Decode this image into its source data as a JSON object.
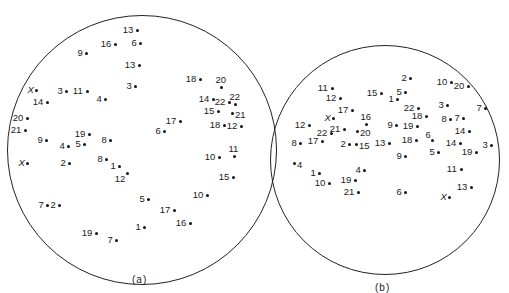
{
  "figure": {
    "panels": [
      {
        "id": "a",
        "caption": "(a)",
        "circle": {
          "cx": 142,
          "cy": 150,
          "r": 135
        },
        "points": [
          {
            "label": "13",
            "x": 137,
            "y": 30,
            "side": "left"
          },
          {
            "label": "6",
            "x": 140,
            "y": 43,
            "side": "left"
          },
          {
            "label": "16",
            "x": 115,
            "y": 44,
            "side": "left"
          },
          {
            "label": "9",
            "x": 86,
            "y": 53,
            "side": "left"
          },
          {
            "label": "13",
            "x": 139,
            "y": 65,
            "side": "left"
          },
          {
            "label": "3",
            "x": 135,
            "y": 86,
            "side": "left"
          },
          {
            "label": "X",
            "x": 36,
            "y": 90,
            "side": "left"
          },
          {
            "label": "3",
            "x": 66,
            "y": 91,
            "side": "left"
          },
          {
            "label": "11",
            "x": 87,
            "y": 91,
            "side": "left"
          },
          {
            "label": "4",
            "x": 105,
            "y": 99,
            "side": "left"
          },
          {
            "label": "14",
            "x": 47,
            "y": 102,
            "side": "left"
          },
          {
            "label": "18",
            "x": 200,
            "y": 79,
            "side": "left"
          },
          {
            "label": "20",
            "x": 221,
            "y": 87,
            "side": "above"
          },
          {
            "label": "14",
            "x": 213,
            "y": 99,
            "side": "left"
          },
          {
            "label": "22",
            "x": 229,
            "y": 102,
            "side": "left"
          },
          {
            "label": "22",
            "x": 235,
            "y": 104,
            "side": "above"
          },
          {
            "label": "15",
            "x": 218,
            "y": 111,
            "side": "left"
          },
          {
            "label": "21",
            "x": 232,
            "y": 113,
            "side": "right"
          },
          {
            "label": "17",
            "x": 180,
            "y": 121,
            "side": "left"
          },
          {
            "label": "6",
            "x": 164,
            "y": 131,
            "side": "left"
          },
          {
            "label": "18",
            "x": 224,
            "y": 125,
            "side": "left"
          },
          {
            "label": "12",
            "x": 241,
            "y": 126,
            "side": "left"
          },
          {
            "label": "20",
            "x": 27,
            "y": 118,
            "side": "left"
          },
          {
            "label": "21",
            "x": 25,
            "y": 130,
            "side": "left"
          },
          {
            "label": "9",
            "x": 46,
            "y": 140,
            "side": "left"
          },
          {
            "label": "4",
            "x": 68,
            "y": 146,
            "side": "left"
          },
          {
            "label": "5",
            "x": 84,
            "y": 144,
            "side": "left"
          },
          {
            "label": "19",
            "x": 89,
            "y": 134,
            "side": "left"
          },
          {
            "label": "8",
            "x": 110,
            "y": 140,
            "side": "left"
          },
          {
            "label": "X",
            "x": 27,
            "y": 163,
            "side": "left"
          },
          {
            "label": "2",
            "x": 69,
            "y": 163,
            "side": "left"
          },
          {
            "label": "8",
            "x": 106,
            "y": 159,
            "side": "left"
          },
          {
            "label": "1",
            "x": 119,
            "y": 166,
            "side": "left"
          },
          {
            "label": "12",
            "x": 127,
            "y": 173,
            "side": "below-left"
          },
          {
            "label": "10",
            "x": 219,
            "y": 157,
            "side": "left"
          },
          {
            "label": "11",
            "x": 234,
            "y": 156,
            "side": "above"
          },
          {
            "label": "15",
            "x": 233,
            "y": 177,
            "side": "left"
          },
          {
            "label": "5",
            "x": 148,
            "y": 199,
            "side": "left"
          },
          {
            "label": "10",
            "x": 207,
            "y": 195,
            "side": "left"
          },
          {
            "label": "7",
            "x": 47,
            "y": 205,
            "side": "left"
          },
          {
            "label": "2",
            "x": 59,
            "y": 205,
            "side": "left"
          },
          {
            "label": "17",
            "x": 174,
            "y": 210,
            "side": "left"
          },
          {
            "label": "1",
            "x": 144,
            "y": 227,
            "side": "left"
          },
          {
            "label": "16",
            "x": 190,
            "y": 223,
            "side": "left"
          },
          {
            "label": "19",
            "x": 96,
            "y": 233,
            "side": "left"
          },
          {
            "label": "7",
            "x": 116,
            "y": 240,
            "side": "left"
          }
        ]
      },
      {
        "id": "b",
        "caption": "(b)",
        "circle": {
          "cx": 385,
          "cy": 160,
          "r": 115
        },
        "points": [
          {
            "label": "2",
            "x": 410,
            "y": 78,
            "side": "left"
          },
          {
            "label": "10",
            "x": 451,
            "y": 82,
            "side": "left"
          },
          {
            "label": "20",
            "x": 468,
            "y": 86,
            "side": "left"
          },
          {
            "label": "11",
            "x": 332,
            "y": 88,
            "side": "left"
          },
          {
            "label": "15",
            "x": 381,
            "y": 93,
            "side": "left"
          },
          {
            "label": "5",
            "x": 405,
            "y": 92,
            "side": "left"
          },
          {
            "label": "1",
            "x": 397,
            "y": 99,
            "side": "left"
          },
          {
            "label": "12",
            "x": 340,
            "y": 98,
            "side": "left"
          },
          {
            "label": "22",
            "x": 418,
            "y": 108,
            "side": "left"
          },
          {
            "label": "3",
            "x": 447,
            "y": 105,
            "side": "left"
          },
          {
            "label": "7",
            "x": 485,
            "y": 108,
            "side": "left"
          },
          {
            "label": "17",
            "x": 352,
            "y": 110,
            "side": "left"
          },
          {
            "label": "18",
            "x": 426,
            "y": 116,
            "side": "left"
          },
          {
            "label": "8",
            "x": 450,
            "y": 119,
            "side": "left"
          },
          {
            "label": "7",
            "x": 463,
            "y": 118,
            "side": "left"
          },
          {
            "label": "X",
            "x": 333,
            "y": 118,
            "side": "left"
          },
          {
            "label": "16",
            "x": 366,
            "y": 124,
            "side": "above"
          },
          {
            "label": "12",
            "x": 309,
            "y": 125,
            "side": "left"
          },
          {
            "label": "21",
            "x": 344,
            "y": 129,
            "side": "left"
          },
          {
            "label": "20",
            "x": 357,
            "y": 131,
            "side": "right"
          },
          {
            "label": "22",
            "x": 331,
            "y": 133,
            "side": "left"
          },
          {
            "label": "9",
            "x": 396,
            "y": 125,
            "side": "left"
          },
          {
            "label": "19",
            "x": 417,
            "y": 126,
            "side": "left"
          },
          {
            "label": "14",
            "x": 469,
            "y": 131,
            "side": "left"
          },
          {
            "label": "8",
            "x": 300,
            "y": 143,
            "side": "left"
          },
          {
            "label": "17",
            "x": 322,
            "y": 141,
            "side": "left"
          },
          {
            "label": "2",
            "x": 349,
            "y": 144,
            "side": "left"
          },
          {
            "label": "15",
            "x": 356,
            "y": 144,
            "side": "right"
          },
          {
            "label": "13",
            "x": 389,
            "y": 143,
            "side": "left"
          },
          {
            "label": "18",
            "x": 416,
            "y": 140,
            "side": "left"
          },
          {
            "label": "6",
            "x": 432,
            "y": 140,
            "side": "above-left"
          },
          {
            "label": "14",
            "x": 460,
            "y": 143,
            "side": "left"
          },
          {
            "label": "19",
            "x": 476,
            "y": 152,
            "side": "left"
          },
          {
            "label": "3",
            "x": 491,
            "y": 145,
            "side": "left"
          },
          {
            "label": "5",
            "x": 438,
            "y": 152,
            "side": "left"
          },
          {
            "label": "9",
            "x": 405,
            "y": 156,
            "side": "left"
          },
          {
            "label": "4",
            "x": 294,
            "y": 163,
            "side": "right"
          },
          {
            "label": "4",
            "x": 364,
            "y": 170,
            "side": "left"
          },
          {
            "label": "11",
            "x": 461,
            "y": 169,
            "side": "left"
          },
          {
            "label": "1",
            "x": 319,
            "y": 173,
            "side": "left"
          },
          {
            "label": "10",
            "x": 329,
            "y": 183,
            "side": "left"
          },
          {
            "label": "19",
            "x": 355,
            "y": 180,
            "side": "left"
          },
          {
            "label": "21",
            "x": 358,
            "y": 192,
            "side": "left"
          },
          {
            "label": "6",
            "x": 405,
            "y": 192,
            "side": "left"
          },
          {
            "label": "13",
            "x": 471,
            "y": 187,
            "side": "left"
          },
          {
            "label": "X",
            "x": 449,
            "y": 197,
            "side": "left"
          }
        ]
      }
    ]
  }
}
